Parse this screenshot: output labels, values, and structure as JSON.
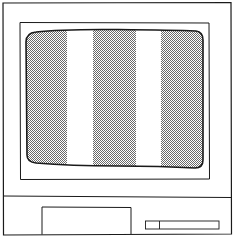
{
  "illustration": {
    "subject": "computer-monitor",
    "colors": {
      "line": "#1a1a1a",
      "background": "#ffffff",
      "screen_gray": "#a8a8a8",
      "stripe_white": "#ffffff"
    },
    "screen": {
      "pattern": "vertical-stripes",
      "stripes": [
        {
          "color": "gray",
          "x_start": 26,
          "x_end": 67
        },
        {
          "color": "white",
          "x_start": 67,
          "x_end": 93
        },
        {
          "color": "gray",
          "x_start": 93,
          "x_end": 136
        },
        {
          "color": "white",
          "x_start": 136,
          "x_end": 161
        },
        {
          "color": "gray",
          "x_start": 161,
          "x_end": 203
        }
      ]
    },
    "base": {
      "drive_bay": "large-rectangle",
      "slot": "small-slot-with-divider"
    }
  }
}
